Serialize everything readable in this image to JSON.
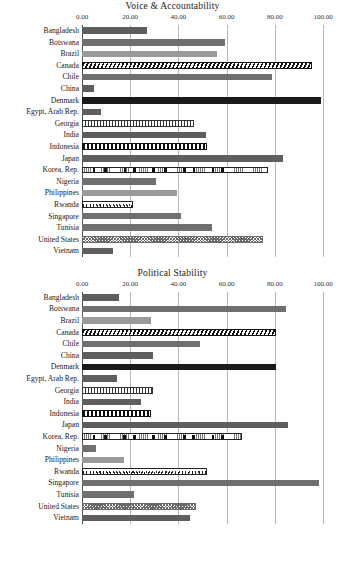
{
  "chart_data": [
    {
      "type": "bar",
      "orientation": "horizontal",
      "title": "Voice & Accountability",
      "xlabel": "",
      "ylabel": "",
      "xlim": [
        0,
        100
      ],
      "xticks": [
        "0.00",
        "20.00",
        "40.00",
        "60.00",
        "80.00",
        "100.00"
      ],
      "grid": true,
      "legend": "none",
      "categories": [
        "Bangladesh",
        "Botswana",
        "Brazil",
        "Canada",
        "Chile",
        "China",
        "Denmark",
        "Egypt, Arab Rep.",
        "Georgia",
        "India",
        "Indonesia",
        "Japan",
        "Korea, Rep.",
        "Nigeria",
        "Philippines",
        "Rwanda",
        "Singapore",
        "Tunisia",
        "United States",
        "Vietnam"
      ],
      "values": [
        27.0,
        59.5,
        56.0,
        95.5,
        79.0,
        5.0,
        99.0,
        8.0,
        46.5,
        51.5,
        52.0,
        83.5,
        77.0,
        30.5,
        39.5,
        21.0,
        41.0,
        54.0,
        75.0,
        13.0
      ]
    },
    {
      "type": "bar",
      "orientation": "horizontal",
      "title": "Political Stability",
      "xlabel": "",
      "ylabel": "",
      "xlim": [
        0,
        100
      ],
      "xticks": [
        "0.00",
        "20.00",
        "40.00",
        "60.00",
        "80.00",
        "100.00"
      ],
      "grid": true,
      "legend": "none",
      "categories": [
        "Bangladesh",
        "Botswana",
        "Brazil",
        "Canada",
        "Chile",
        "China",
        "Denmark",
        "Egypt, Arab Rep.",
        "Georgia",
        "India",
        "Indonesia",
        "Japan",
        "Korea, Rep.",
        "Nigeria",
        "Philippines",
        "Rwanda",
        "Singapore",
        "Tunisia",
        "United States",
        "Vietnam"
      ],
      "values": [
        15.5,
        84.5,
        28.5,
        80.5,
        49.0,
        29.5,
        80.5,
        14.5,
        29.5,
        24.5,
        28.5,
        85.5,
        66.5,
        6.0,
        17.5,
        52.0,
        98.5,
        21.5,
        47.5,
        45.0
      ]
    }
  ],
  "styles": {
    "Bangladesh": "f-dark",
    "Botswana": "f-mid",
    "Brazil": "f-light",
    "Canada": "f-diag",
    "Chile": "f-mid",
    "China": "f-dark",
    "Denmark": "f-black",
    "Egypt, Arab Rep.": "f-dark",
    "Georgia": "f-vstripe",
    "India": "f-dark",
    "Indonesia": "f-vthick",
    "Japan": "f-dark",
    "Korea, Rep.": "f-blocks",
    "Nigeria": "f-mid",
    "Philippines": "f-light",
    "Rwanda": "f-dots",
    "Singapore": "f-mid",
    "Tunisia": "f-mid",
    "United States": "f-check",
    "Vietnam": "f-dark"
  }
}
